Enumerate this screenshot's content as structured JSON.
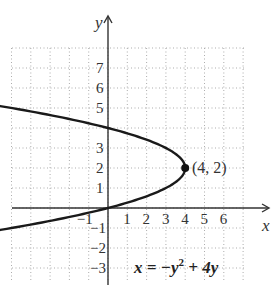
{
  "chart_data": {
    "type": "line",
    "title": "",
    "xlabel": "x",
    "ylabel": "y",
    "equation": "x = −y² + 4y",
    "equation_parts": {
      "lhs": "x = −y",
      "exp": "2",
      "rhs": " + 4y"
    },
    "xlim": [
      -1.6,
      6.5
    ],
    "ylim": [
      -3.5,
      8
    ],
    "x_ticks": [
      -1,
      1,
      2,
      3,
      4,
      5,
      6
    ],
    "y_ticks": [
      7,
      6,
      5,
      3,
      2,
      1,
      -1,
      -2,
      -3
    ],
    "tick_labels": {
      "x": [
        "−1",
        "1",
        "2",
        "3",
        "4",
        "5",
        "6"
      ],
      "y": [
        "7",
        "6",
        "5",
        "3",
        "2",
        "1",
        "−1",
        "−2",
        "−3"
      ]
    },
    "grid": true,
    "series": [
      {
        "name": "x = -y^2 + 4y",
        "y_range": [
          -1.2,
          5.15
        ],
        "color": "#1a1a1a"
      }
    ],
    "annotations": [
      {
        "label": "(4, 2)",
        "x": 4,
        "y": 2,
        "marker": "dot"
      }
    ]
  }
}
